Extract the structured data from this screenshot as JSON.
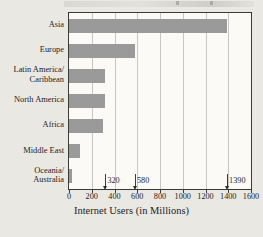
{
  "chart_data": {
    "type": "bar",
    "orientation": "horizontal",
    "title": "",
    "xlabel": "Internet Users (in Millions)",
    "ylabel": "",
    "categories": [
      "Asia",
      "Europe",
      "Latin America/\nCaribbean",
      "North America",
      "Africa",
      "Middle East",
      "Oceania/\nAustralia"
    ],
    "values": [
      1390,
      580,
      320,
      320,
      300,
      100,
      25
    ],
    "xlim": [
      0,
      1600
    ],
    "xticks": [
      0,
      200,
      400,
      600,
      800,
      1000,
      1200,
      1400,
      1600
    ],
    "xtick_labels": [
      "0",
      "200",
      "400",
      "600",
      "800",
      "1000",
      "1200",
      "1400",
      "1600"
    ],
    "grid": "vertical",
    "legend": null,
    "bar_color": "#9a9a9a",
    "plot_background": "#fbfaf7",
    "frame_color": "#3a3a3a",
    "annotations": [
      {
        "label": "320",
        "value": 320
      },
      {
        "label": "580",
        "value": 580
      },
      {
        "label": "1390",
        "value": 1390
      }
    ]
  }
}
